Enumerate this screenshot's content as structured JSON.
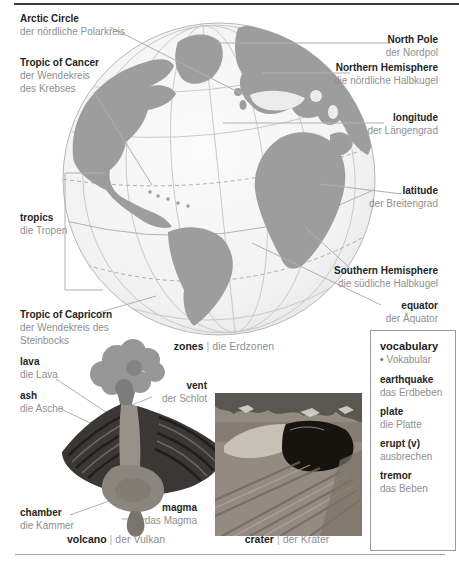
{
  "separator": "|",
  "palette": {
    "land_gray": "#9d9d9d",
    "ocean_light": "#f2f2f2",
    "english_text": "#252525",
    "german_text": "#8f8f8f",
    "leader_line": "#b0b0b0",
    "top_rule": "#3d3d3d"
  },
  "globe": {
    "caption": {
      "en": "zones",
      "de": "die Erdzonen"
    },
    "labels": {
      "arctic_circle": {
        "en": "Arctic Circle",
        "de": "der nördliche Polarkreis"
      },
      "tropic_of_cancer": {
        "en": "Tropic of Cancer",
        "de": "der Wendekreis des Krebses"
      },
      "north_pole": {
        "en": "North Pole",
        "de": "der Nordpol"
      },
      "northern_hemisphere": {
        "en": "Northern Hemisphere",
        "de": "die nördliche Halbkugel"
      },
      "longitude": {
        "en": "longitude",
        "de": "der Längengrad"
      },
      "latitude": {
        "en": "latitude",
        "de": "der Breitengrad"
      },
      "tropics": {
        "en": "tropics",
        "de": "die Tropen"
      },
      "southern_hemisphere": {
        "en": "Southern Hemisphere",
        "de": "die südliche Halbkugel"
      },
      "equator": {
        "en": "equator",
        "de": "der Äquator"
      },
      "tropic_of_capricorn": {
        "en": "Tropic of Capricorn",
        "de": "der Wendekreis des Steinbocks"
      }
    }
  },
  "volcano": {
    "caption": {
      "en": "volcano",
      "de": "der Vulkan"
    },
    "labels": {
      "lava": {
        "en": "lava",
        "de": "die Lava"
      },
      "ash": {
        "en": "ash",
        "de": "die Asche"
      },
      "vent": {
        "en": "vent",
        "de": "der Schlot"
      },
      "chamber": {
        "en": "chamber",
        "de": "die Kammer"
      },
      "magma": {
        "en": "magma",
        "de": "das Magma"
      }
    }
  },
  "crater": {
    "caption": {
      "en": "crater",
      "de": "der Krater"
    }
  },
  "vocabulary": {
    "title": "vocabulary",
    "bullet": "•",
    "subtitle": "Vokabular",
    "entries": [
      {
        "en": "earthquake",
        "de": "das Erdbeben"
      },
      {
        "en": "plate",
        "de": "die Platte"
      },
      {
        "en": "erupt (v)",
        "de": "ausbrechen"
      },
      {
        "en": "tremor",
        "de": "das Beben"
      }
    ]
  }
}
